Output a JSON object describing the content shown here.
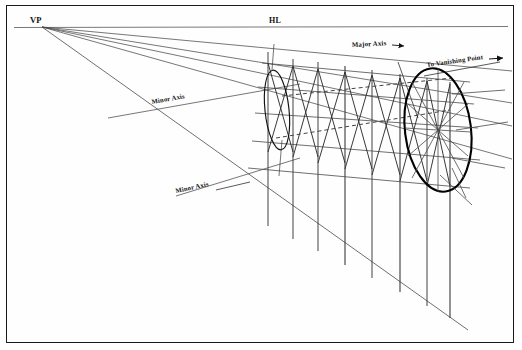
{
  "figure": {
    "type": "technical-line-drawing",
    "background_color": "#ffffff",
    "border_color": "#1a1a1a",
    "line_color": "#3a3a3a",
    "bold_line_color": "#000000",
    "dashed_line_color": "#4a4a4a"
  },
  "labels": {
    "vanishing_point": "VP",
    "horizon_line": "HL",
    "minor_axis_upper": "Minor Axis",
    "minor_axis_lower": "Minor Axis",
    "major_axis": "Major Axis",
    "major_axis_arrow": "→",
    "to_vanishing_point": "To Vanishing Point",
    "to_vanishing_point_arrow": "→"
  },
  "geometry": {
    "vanishing_point": {
      "x": 42,
      "y": 27
    },
    "horizon_line": {
      "x1": 14,
      "y1": 27,
      "x2": 508,
      "y2": 26
    },
    "rays": [
      {
        "name": "ray-top-edge",
        "x2": 512,
        "y2": 72
      },
      {
        "name": "ray-upper-mid",
        "x2": 512,
        "y2": 104
      },
      {
        "name": "ray-center",
        "x2": 512,
        "y2": 127
      },
      {
        "name": "ray-lower-mid",
        "x2": 512,
        "y2": 160
      },
      {
        "name": "ray-ground",
        "x2": 470,
        "y2": 330
      }
    ],
    "verticals": [
      {
        "name": "vertical-1",
        "x": 268,
        "top": 52,
        "bottom": 225
      },
      {
        "name": "vertical-2",
        "x": 293,
        "top": 60,
        "bottom": 238
      },
      {
        "name": "vertical-3",
        "x": 318,
        "top": 62,
        "bottom": 250
      },
      {
        "name": "vertical-4",
        "x": 345,
        "top": 66,
        "bottom": 264
      },
      {
        "name": "vertical-5",
        "x": 372,
        "top": 70,
        "bottom": 278
      },
      {
        "name": "vertical-6",
        "x": 400,
        "top": 74,
        "bottom": 292
      },
      {
        "name": "vertical-7",
        "x": 427,
        "top": 78,
        "bottom": 306
      },
      {
        "name": "vertical-8",
        "x": 450,
        "top": 82,
        "bottom": 318
      }
    ],
    "ellipses": [
      {
        "name": "ellipse-small-far",
        "cx": 277,
        "cy": 110,
        "rx": 12,
        "ry": 40,
        "rotation": -6,
        "stroke_width": 1.1
      },
      {
        "name": "ellipse-large-near",
        "cx": 438,
        "cy": 130,
        "rx": 33,
        "ry": 62,
        "rotation": -7,
        "stroke_width": 2.2
      }
    ],
    "axis_counts": {
      "rays_from_vp": 5,
      "verticals": 8,
      "ellipses": 2
    }
  }
}
